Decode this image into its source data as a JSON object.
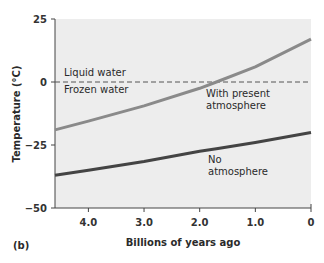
{
  "chart_data": {
    "type": "line",
    "panel_label": "(b)",
    "xlabel": "Billions of years ago",
    "ylabel": "Temperature (°C)",
    "xlim": [
      4.6,
      0
    ],
    "ylim": [
      -50,
      25
    ],
    "x_ticks": [
      "4.0",
      "3.0",
      "2.0",
      "1.0",
      "0"
    ],
    "y_ticks": [
      "25",
      "0",
      "−25",
      "−50"
    ],
    "grid": false,
    "reference_line": {
      "y": 0,
      "style": "dashed",
      "label_above": "Liquid water",
      "label_below": "Frozen water"
    },
    "x": [
      4.6,
      4.0,
      3.0,
      2.0,
      1.7,
      1.0,
      0
    ],
    "series": [
      {
        "name": "With present atmosphere",
        "label_lines": [
          "With present",
          "atmosphere"
        ],
        "color": "#8a8a8a",
        "values": [
          -19,
          -15.5,
          -9.5,
          -2.5,
          0,
          6,
          17
        ]
      },
      {
        "name": "No atmosphere",
        "label_lines": [
          "No",
          "atmosphere"
        ],
        "color": "#444444",
        "values": [
          -37,
          -35,
          -31.5,
          -27.5,
          -26.5,
          -24,
          -20
        ]
      }
    ]
  }
}
